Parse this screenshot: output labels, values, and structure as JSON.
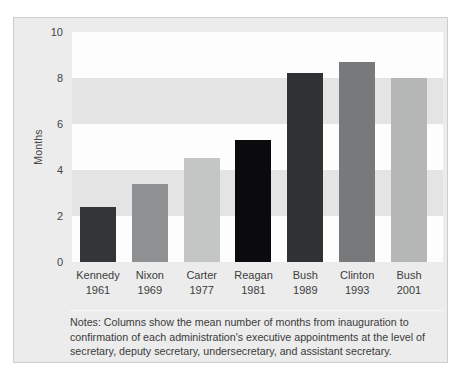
{
  "figure": {
    "y_axis_label": "Months",
    "notes_text": "Notes: Columns show the mean number of months from inauguration to confirmation of each administration's executive appointments at the level of secretary, deputy secretary, undersecretary, and assistant secretary."
  },
  "chart_data": {
    "type": "bar",
    "title": "",
    "xlabel": "",
    "ylabel": "Months",
    "ylim": [
      0,
      10
    ],
    "yticks": [
      0,
      2,
      4,
      6,
      8,
      10
    ],
    "grid": "horizontal-bands-every-2-units",
    "legend": "none",
    "bands_top_to_bottom": [
      "light",
      "dark",
      "light",
      "dark",
      "light"
    ],
    "band_colors": {
      "light": "#fdfdfd",
      "dark": "#e3e4e3"
    },
    "categories": [
      "Kennedy",
      "Nixon",
      "Carter",
      "Reagan",
      "Bush",
      "Clinton",
      "Bush"
    ],
    "years": [
      "1961",
      "1969",
      "1977",
      "1981",
      "1989",
      "1993",
      "2001"
    ],
    "values": [
      2.4,
      3.4,
      4.5,
      5.3,
      8.2,
      8.7,
      8.0
    ],
    "bar_colors": [
      "#333538",
      "#8e9092",
      "#c4c6c5",
      "#0b0b0d",
      "#2f3133",
      "#77797b",
      "#b5b7b6"
    ]
  }
}
